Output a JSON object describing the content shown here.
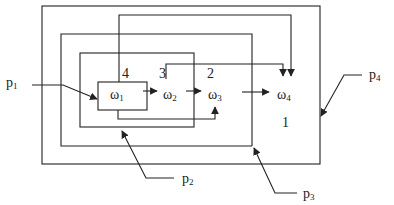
{
  "diagram": {
    "nodes": [
      {
        "id": "w1",
        "symbol": "ω",
        "sub": "1"
      },
      {
        "id": "w2",
        "symbol": "ω",
        "sub": "2"
      },
      {
        "id": "w3",
        "symbol": "ω",
        "sub": "3"
      },
      {
        "id": "w4",
        "symbol": "ω",
        "sub": "4"
      }
    ],
    "region_numbers": [
      "4",
      "3",
      "2",
      "1"
    ],
    "inputs": [
      {
        "id": "p1",
        "symbol": "p",
        "sub": "1"
      },
      {
        "id": "p2",
        "symbol": "p",
        "sub": "2"
      },
      {
        "id": "p3",
        "symbol": "p",
        "sub": "3"
      },
      {
        "id": "p4",
        "symbol": "p",
        "sub": "4"
      }
    ],
    "colors": {
      "line": "#222222",
      "background": "#ffffff"
    }
  }
}
